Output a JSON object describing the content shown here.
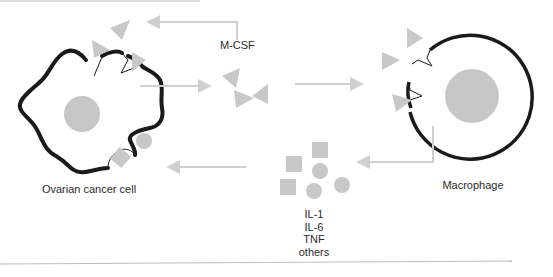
{
  "diagram": {
    "type": "cell-signaling-schematic",
    "labels": {
      "cancer_cell": "Ovarian cancer cell",
      "macrophage": "Macrophage",
      "mcsf": "M-CSF"
    },
    "cytokines": [
      "IL-1",
      "IL-6",
      "TNF",
      "others"
    ],
    "nodes": [
      {
        "id": "cancer_cell",
        "label": "Ovarian cancer cell",
        "shape": "irregular-membrane-with-nucleus"
      },
      {
        "id": "macrophage",
        "label": "Macrophage",
        "shape": "circle-with-nucleus"
      },
      {
        "id": "mcsf",
        "label": "M-CSF",
        "shape": "triangles"
      },
      {
        "id": "cytokines",
        "label": "IL-1, IL-6, TNF, others",
        "shape": "squares-and-circles"
      }
    ],
    "edges": [
      {
        "from": "mcsf",
        "to": "cancer_cell",
        "style": "elbow-arrow",
        "note": "autocrine loop back to cancer cell receptors"
      },
      {
        "from": "cancer_cell",
        "to": "mcsf",
        "style": "arrow"
      },
      {
        "from": "mcsf",
        "to": "macrophage",
        "style": "arrow"
      },
      {
        "from": "macrophage",
        "to": "cytokines",
        "style": "elbow-arrow"
      },
      {
        "from": "cytokines",
        "to": "cancer_cell",
        "style": "arrow"
      }
    ],
    "colors": {
      "membrane": "#1a1a1a",
      "ligand_gray": "#c8c8c8",
      "nucleus_gray": "#c6c6c6",
      "arrow_gray": "#cfcfcf",
      "text": "#2a2a2a",
      "rule_line": "#bdbdbd"
    }
  }
}
